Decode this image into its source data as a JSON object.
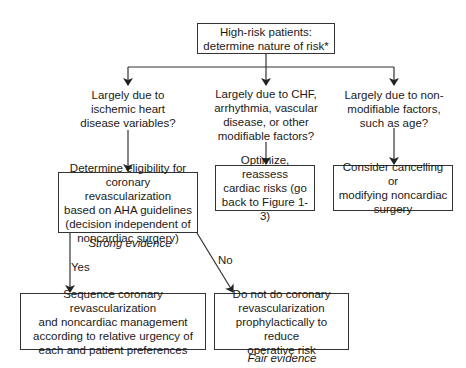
{
  "diagram": {
    "type": "flowchart",
    "root": {
      "text": "High-risk patients:\ndetermine nature of risk*"
    },
    "questions": [
      {
        "id": "ischemic",
        "text": "Largely due to\nischemic heart\ndisease variables?"
      },
      {
        "id": "modifiable",
        "text": "Largely due to CHF,\narrhythmia, vascular\ndisease, or other\nmodifiable factors?"
      },
      {
        "id": "nonmodifiable",
        "text": "Largely due to non-\nmodifiable factors,\nsuch as age?"
      }
    ],
    "actions": {
      "eligibility": {
        "text": "Determine eligibility for\ncoronary revascularization\nbased on AHA guidelines\n(decision independent of\nnoncardiac surgery)",
        "evidence": "Strong evidence"
      },
      "optimize": {
        "text": "Optimize, reassess\ncardiac risks (go\nback to Figure 1-3)"
      },
      "cancel": {
        "text": "Consider cancelling or\nmodifying noncardiac\nsurgery"
      },
      "sequence": {
        "text": "Sequence coronary revascularization\nand noncardiac management\naccording to relative urgency of\neach and patient preferences"
      },
      "no_revasc": {
        "text": "Do not do coronary\nrevascularization\nprophylactically to reduce\noperative risk",
        "evidence": "Fair evidence"
      }
    },
    "edge_labels": {
      "yes": "Yes",
      "no": "No"
    },
    "edges": [
      {
        "from": "root",
        "to": "ischemic"
      },
      {
        "from": "root",
        "to": "modifiable"
      },
      {
        "from": "root",
        "to": "nonmodifiable"
      },
      {
        "from": "ischemic",
        "to": "eligibility"
      },
      {
        "from": "modifiable",
        "to": "optimize"
      },
      {
        "from": "nonmodifiable",
        "to": "cancel"
      },
      {
        "from": "eligibility",
        "to": "sequence",
        "label": "Yes"
      },
      {
        "from": "eligibility",
        "to": "no_revasc",
        "label": "No"
      }
    ]
  }
}
